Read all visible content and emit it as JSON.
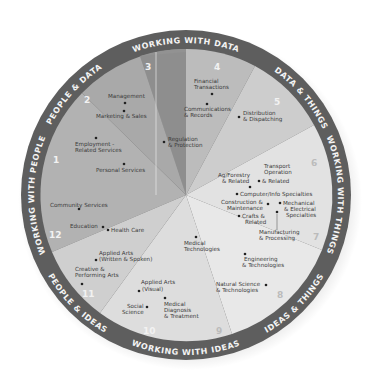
{
  "diagram": {
    "band_labels": {
      "top": "WORKING WITH DATA",
      "top_right": "DATA & THINGS",
      "right": "WORKING WITH THINGS",
      "bottom_right": "IDEAS & THINGS",
      "bottom": "WORKING WITH IDEAS",
      "bottom_left": "PEOPLE & IDEAS",
      "left": "WORKING WITH PEOPLE",
      "top_left": "PEOPLE & DATA"
    },
    "region_numbers": [
      "1",
      "2",
      "3",
      "4",
      "5",
      "6",
      "7",
      "8",
      "9",
      "10",
      "11",
      "12"
    ],
    "career_areas": [
      {
        "id": "management",
        "label1": "Management",
        "label2": ""
      },
      {
        "id": "marketing",
        "label1": "Marketing & Sales",
        "label2": ""
      },
      {
        "id": "employment",
        "label1": "Employment -",
        "label2": "Related Services"
      },
      {
        "id": "personal",
        "label1": "Personal Services",
        "label2": ""
      },
      {
        "id": "regulation",
        "label1": "Regulation",
        "label2": "& Protection"
      },
      {
        "id": "financial",
        "label1": "Financial",
        "label2": "Transactions"
      },
      {
        "id": "communications",
        "label1": "Communications",
        "label2": "& Records"
      },
      {
        "id": "distribution",
        "label1": "Distribution",
        "label2": "& Dispatching"
      },
      {
        "id": "transport",
        "label1": "Transport",
        "label2": "Operation",
        "label3": "& Related"
      },
      {
        "id": "agforestry",
        "label1": "Ag/Forestry",
        "label2": "& Related"
      },
      {
        "id": "computer",
        "label1": "Computer/Info Specialties",
        "label2": ""
      },
      {
        "id": "construction",
        "label1": "Construction &",
        "label2": "Maintenance"
      },
      {
        "id": "mechanical",
        "label1": "Mechanical",
        "label2": "& Electrical",
        "label3": "Specialties"
      },
      {
        "id": "crafts",
        "label1": "Crafts &",
        "label2": "Related"
      },
      {
        "id": "manufacturing",
        "label1": "Manufacturing",
        "label2": "& Processing"
      },
      {
        "id": "engineering",
        "label1": "Engineering",
        "label2": "& Technologies"
      },
      {
        "id": "natural",
        "label1": "Natural Science",
        "label2": "& Technologies"
      },
      {
        "id": "medtech",
        "label1": "Medical",
        "label2": "Technologies"
      },
      {
        "id": "meddiag",
        "label1": "Medical",
        "label2": "Diagnosis",
        "label3": "& Treatment"
      },
      {
        "id": "social",
        "label1": "Social",
        "label2": "Science"
      },
      {
        "id": "artsvisual",
        "label1": "Applied Arts",
        "label2": "(Visual)"
      },
      {
        "id": "creative",
        "label1": "Creative &",
        "label2": "Performing Arts"
      },
      {
        "id": "artswritten",
        "label1": "Applied Arts",
        "label2": "(Written & Spoken)"
      },
      {
        "id": "education",
        "label1": "Education",
        "label2": ""
      },
      {
        "id": "health",
        "label1": "Health Care",
        "label2": ""
      },
      {
        "id": "community",
        "label1": "Community Services",
        "label2": ""
      }
    ],
    "colors": {
      "band": "#5e5e5e",
      "people_data": "#a8a8a8",
      "data_dark": "#8f8f8f",
      "data_mid": "#b9b9b9",
      "data_things": "#cfcfcf",
      "things": "#e3e3e3",
      "ideas_things": "#e9e9e9",
      "ideas": "#dcdcdc",
      "people_ideas": "#cdcdcd",
      "people": "#b4b4b4"
    }
  }
}
